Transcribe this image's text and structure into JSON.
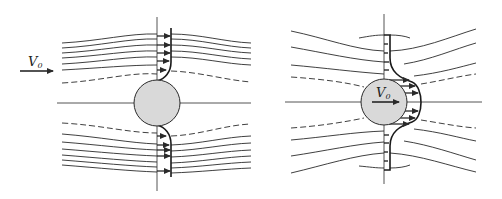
{
  "figure": {
    "colors": {
      "line": "#2a2a2a",
      "sphere_fill": "#d9d9d9",
      "background": "#ffffff"
    },
    "left_panel": {
      "velocity_label": "V",
      "velocity_subscript": "0",
      "arrow_direction": "right",
      "streamline_style": [
        "solid",
        "dashed"
      ],
      "profile": "velocity profile along vertical axis with arrows, zero at sphere surface"
    },
    "right_panel": {
      "velocity_label": "V",
      "velocity_subscript": "0",
      "arrow_direction": "right",
      "profile": "velocity profile bulging to the right, maximum at sphere"
    }
  }
}
